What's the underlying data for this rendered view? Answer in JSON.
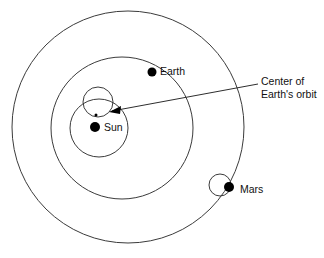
{
  "diagram": {
    "background_color": "#ffffff",
    "stroke_color": "#3b3b3b",
    "body_color": "#000000",
    "text_color": "#111111",
    "labels": {
      "sun": "Sun",
      "earth": "Earth",
      "mars": "Mars",
      "center_line1": "Center of",
      "center_line2": "Earth's orbit"
    },
    "orbits": [
      {
        "name": "mars-orbit",
        "cx": 128,
        "cy": 127,
        "r": 116
      },
      {
        "name": "earth-orbit",
        "cx": 122,
        "cy": 128,
        "r": 71
      },
      {
        "name": "sun-orbit",
        "cx": 99,
        "cy": 128,
        "r": 29
      }
    ],
    "epicycles": [
      {
        "name": "center-epicycle",
        "cx": 98,
        "cy": 102,
        "r": 15
      },
      {
        "name": "mars-epicycle",
        "cx": 220,
        "cy": 185,
        "r": 11
      }
    ],
    "bodies": [
      {
        "name": "sun",
        "cx": 95,
        "cy": 127,
        "r": 5
      },
      {
        "name": "earth",
        "cx": 152,
        "cy": 72,
        "r": 4.5
      },
      {
        "name": "mars",
        "cx": 229,
        "cy": 187,
        "r": 5
      }
    ],
    "center_marker": {
      "cx": 96,
      "cy": 115,
      "r": 1.5
    },
    "leader_line": {
      "x1": 112,
      "y1": 111,
      "x2": 258,
      "y2": 84
    },
    "arrow_tip": {
      "x": 110,
      "y": 111
    },
    "label_positions": {
      "sun": {
        "x": 104,
        "y": 128
      },
      "earth": {
        "x": 160,
        "y": 72
      },
      "mars": {
        "x": 240,
        "y": 190
      },
      "center": {
        "x": 261,
        "y": 82
      }
    }
  }
}
